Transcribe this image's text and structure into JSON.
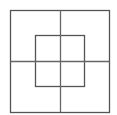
{
  "diagram": {
    "type": "nested-squares-grid",
    "canvas": {
      "width": 117,
      "height": 115,
      "background": "#ffffff"
    },
    "stroke_color": "#555555",
    "outer_square": {
      "x": 10.5,
      "y": 10.5,
      "width": 99,
      "height": 102
    },
    "inner_square": {
      "x": 35.5,
      "y": 35.5,
      "width": 49,
      "height": 51
    },
    "vertical_line": {
      "x": 60.5,
      "y1": 10.5,
      "y2": 112.5
    },
    "horizontal_line": {
      "y": 61.5,
      "x1": 10.5,
      "x2": 109.5
    }
  }
}
